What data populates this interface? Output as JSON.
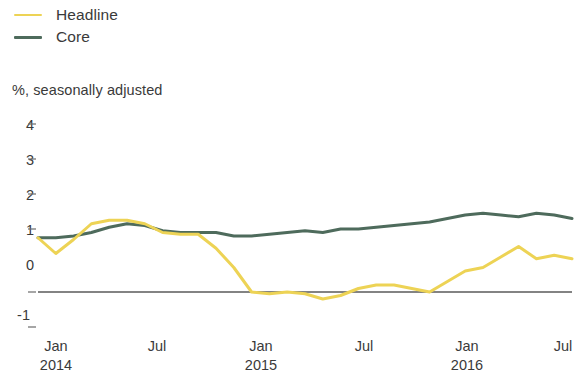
{
  "legend": {
    "position": "top-left",
    "items": [
      {
        "label": "Headline",
        "color": "#edd355",
        "name": "headline"
      },
      {
        "label": "Core",
        "color": "#4e6b5c",
        "name": "core"
      }
    ]
  },
  "subtitle": "%, seasonally adjusted",
  "axes": {
    "y": {
      "ticks": [
        "4",
        "3",
        "2",
        "1",
        "0",
        "-1"
      ],
      "values": [
        4,
        3,
        2,
        1,
        0,
        -1
      ],
      "min": -1,
      "max": 4
    },
    "x": {
      "ticks": [
        {
          "month": "Jan",
          "year": "2014"
        },
        {
          "month": "Jul",
          "year": ""
        },
        {
          "month": "Jan",
          "year": "2015"
        },
        {
          "month": "Jul",
          "year": ""
        },
        {
          "month": "Jan",
          "year": "2016"
        },
        {
          "month": "Jul",
          "year": ""
        }
      ]
    }
  },
  "chart_data": {
    "type": "line",
    "title": "",
    "subtitle": "%, seasonally adjusted",
    "xlabel": "",
    "ylabel": "%, seasonally adjusted",
    "ylim": [
      -1,
      4
    ],
    "yticks": [
      -1,
      0,
      1,
      2,
      3,
      4
    ],
    "grid": false,
    "zero_line": true,
    "legend_position": "top-left",
    "x": [
      "2014-01",
      "2014-02",
      "2014-03",
      "2014-04",
      "2014-05",
      "2014-06",
      "2014-07",
      "2014-08",
      "2014-09",
      "2014-10",
      "2014-11",
      "2014-12",
      "2015-01",
      "2015-02",
      "2015-03",
      "2015-04",
      "2015-05",
      "2015-06",
      "2015-07",
      "2015-08",
      "2015-09",
      "2015-10",
      "2015-11",
      "2015-12",
      "2016-01",
      "2016-02",
      "2016-03",
      "2016-04",
      "2016-05",
      "2016-06",
      "2016-07"
    ],
    "xtick_labels": [
      "Jan 2014",
      "Jul",
      "Jan 2015",
      "Jul",
      "Jan 2016",
      "Jul"
    ],
    "series": [
      {
        "name": "Headline",
        "color": "#edd355",
        "values": [
          1.55,
          1.1,
          1.5,
          1.95,
          2.05,
          2.05,
          1.95,
          1.7,
          1.65,
          1.65,
          1.25,
          0.7,
          0.0,
          -0.05,
          0.0,
          -0.05,
          -0.2,
          -0.1,
          0.1,
          0.2,
          0.2,
          0.1,
          0.0,
          0.3,
          0.6,
          0.7,
          1.0,
          1.3,
          0.95,
          1.05,
          0.95
        ]
      },
      {
        "name": "Core",
        "color": "#4e6b5c",
        "values": [
          1.55,
          1.55,
          1.6,
          1.7,
          1.85,
          1.95,
          1.9,
          1.75,
          1.7,
          1.7,
          1.7,
          1.6,
          1.6,
          1.65,
          1.7,
          1.75,
          1.7,
          1.8,
          1.8,
          1.85,
          1.9,
          1.95,
          2.0,
          2.1,
          2.2,
          2.25,
          2.2,
          2.15,
          2.25,
          2.2,
          2.1
        ]
      }
    ]
  }
}
